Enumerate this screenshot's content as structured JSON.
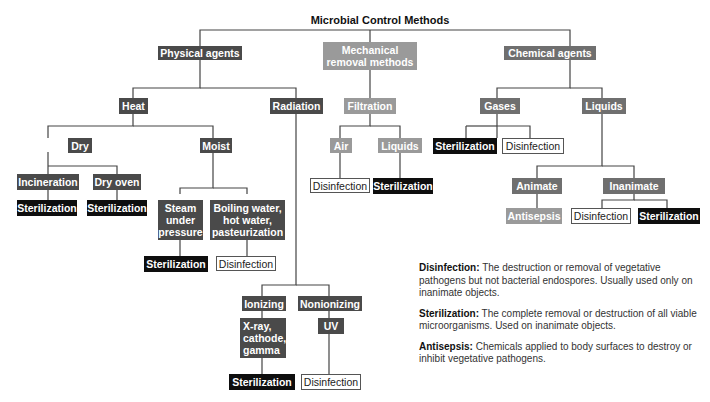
{
  "title": "Microbial Control Methods",
  "nodes": {
    "physical": "Physical agents",
    "mechanical": "Mechanical removal methods",
    "chemical": "Chemical agents",
    "heat": "Heat",
    "radiation": "Radiation",
    "filtration": "Filtration",
    "gases": "Gases",
    "liquids_chem": "Liquids",
    "dry": "Dry",
    "moist": "Moist",
    "air": "Air",
    "liquids_filt": "Liquids",
    "incineration": "Incineration",
    "dry_oven": "Dry oven",
    "steam": "Steam under pressure",
    "boiling": "Boiling water, hot water, pasteurization",
    "ionizing": "Ionizing",
    "nonionizing": "Nonionizing",
    "xray": "X-ray, cathode, gamma",
    "uv": "UV",
    "animate": "Animate",
    "inanimate": "Inanimate",
    "gases_ster": "Sterilization",
    "gases_dis": "Disinfection",
    "air_dis": "Disinfection",
    "liq_ster": "Sterilization",
    "incin_ster": "Sterilization",
    "oven_ster": "Sterilization",
    "steam_ster": "Sterilization",
    "boil_dis": "Disinfection",
    "ion_ster": "Sterilization",
    "uv_dis": "Disinfection",
    "antisepsis": "Antisepsis",
    "inan_dis": "Disinfection",
    "inan_ster": "Sterilization"
  },
  "legend": [
    {
      "term": "Disinfection:",
      "text": " The destruction or removal of vegetative pathogens but not bacterial endospores. Usually used only on inanimate objects."
    },
    {
      "term": "Sterilization:",
      "text": " The complete removal or destruction of all viable microorganisms. Used on inanimate objects."
    },
    {
      "term": "Antisepsis:",
      "text": " Chemicals applied to body surfaces to destroy or inhibit vegetative pathogens."
    }
  ]
}
